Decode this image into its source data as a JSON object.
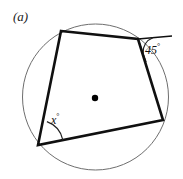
{
  "figure": {
    "part_label": "(a)",
    "canvas": {
      "width": 183,
      "height": 179,
      "background": "#ffffff"
    },
    "colors": {
      "circle_stroke": "#6e6e6e",
      "polygon_stroke": "#101010",
      "center_dot": "#000000",
      "arc_stroke": "#222222",
      "text": "#111111"
    },
    "circle": {
      "center_x": 95.5,
      "center_y": 97,
      "radius": 73,
      "stroke_width": 1
    },
    "center_point": {
      "x": 95,
      "y": 98,
      "radius": 3.2
    },
    "quadrilateral": {
      "stroke_width": 2.6,
      "vertices": [
        {
          "name": "top-left",
          "x": 61,
          "y": 31
        },
        {
          "name": "top-right",
          "x": 138,
          "y": 39
        },
        {
          "name": "right",
          "x": 163,
          "y": 120
        },
        {
          "name": "bottom-left",
          "x": 38,
          "y": 145
        }
      ]
    },
    "tangent_line": {
      "from_x": 138,
      "from_y": 39,
      "to_x": 172,
      "to_y": 36,
      "stroke_width": 1.6
    },
    "angles": [
      {
        "id": "exterior-45",
        "label_value": "45",
        "label_degree": "°",
        "vertex_x": 138,
        "vertex_y": 39,
        "arc_radius": 15
      },
      {
        "id": "interior-x",
        "label_value": "x",
        "label_degree": "°",
        "vertex_x": 38,
        "vertex_y": 145,
        "arc_radius": 25
      }
    ]
  }
}
